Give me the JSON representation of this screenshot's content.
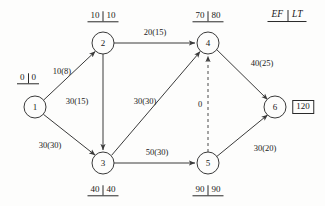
{
  "diagram": {
    "legend": {
      "ef_label": "EF",
      "lt_label": "LT",
      "x": 287,
      "y": 16
    },
    "colors": {
      "line": "#3a3a3a",
      "text": "#1a1a1a",
      "background": "#fdfdfc"
    },
    "nodes": [
      {
        "id": "1",
        "label": "1",
        "x": 35,
        "y": 107,
        "r": 11,
        "time_pair": {
          "ef": "0",
          "lt": "0",
          "x": 28,
          "y": 79,
          "position": "above"
        }
      },
      {
        "id": "2",
        "label": "2",
        "x": 103,
        "y": 43,
        "r": 11,
        "time_pair": {
          "ef": "10",
          "lt": "10",
          "x": 103,
          "y": 17,
          "position": "above"
        }
      },
      {
        "id": "3",
        "label": "3",
        "x": 103,
        "y": 163,
        "r": 11,
        "time_pair": {
          "ef": "40",
          "lt": "40",
          "x": 103,
          "y": 191,
          "position": "below"
        }
      },
      {
        "id": "4",
        "label": "4",
        "x": 208,
        "y": 43,
        "r": 11,
        "time_pair": {
          "ef": "70",
          "lt": "80",
          "x": 208,
          "y": 17,
          "position": "above"
        }
      },
      {
        "id": "5",
        "label": "5",
        "x": 208,
        "y": 163,
        "r": 11,
        "time_pair": {
          "ef": "90",
          "lt": "90",
          "x": 208,
          "y": 191,
          "position": "below"
        }
      },
      {
        "id": "6",
        "label": "6",
        "x": 275,
        "y": 107,
        "r": 11,
        "boxed_value": {
          "value": "120",
          "x": 303,
          "y": 107
        }
      }
    ],
    "edges": [
      {
        "from": "1",
        "to": "2",
        "label": "10(8)",
        "label_x": 62,
        "label_y": 71,
        "style": "solid"
      },
      {
        "from": "1",
        "to": "3",
        "label": "30(30)",
        "label_x": 50,
        "label_y": 145,
        "style": "solid"
      },
      {
        "from": "2",
        "to": "3",
        "label": "30(15)",
        "label_x": 77,
        "label_y": 101,
        "style": "solid"
      },
      {
        "from": "2",
        "to": "4",
        "label": "20(15)",
        "label_x": 155,
        "label_y": 32,
        "style": "solid"
      },
      {
        "from": "3",
        "to": "4",
        "label": "30(30)",
        "label_x": 145,
        "label_y": 101,
        "style": "solid"
      },
      {
        "from": "3",
        "to": "5",
        "label": "50(30)",
        "label_x": 157,
        "label_y": 152,
        "style": "solid"
      },
      {
        "from": "5",
        "to": "4",
        "label": "0",
        "label_x": 200,
        "label_y": 104,
        "style": "dashed"
      },
      {
        "from": "4",
        "to": "6",
        "label": "40(25)",
        "label_x": 262,
        "label_y": 63,
        "style": "solid"
      },
      {
        "from": "5",
        "to": "6",
        "label": "30(20)",
        "label_x": 265,
        "label_y": 148,
        "style": "solid"
      }
    ]
  }
}
